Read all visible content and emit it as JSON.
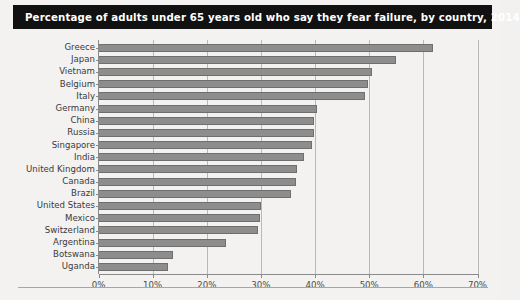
{
  "title": "Percentage of adults under 65 years old who say they fear failure, by country, 2014",
  "chart_data": {
    "type": "bar",
    "orientation": "horizontal",
    "title": "Percentage of adults under 65 years old who say they fear failure, by country, 2014",
    "xlabel": "",
    "ylabel": "",
    "xlim": [
      0,
      70
    ],
    "grid": true,
    "legend": "none",
    "xticks": [
      "0%",
      "10%",
      "20%",
      "30%",
      "40%",
      "50%",
      "60%",
      "70%"
    ],
    "xtick_values": [
      0,
      10,
      20,
      30,
      40,
      50,
      60,
      70
    ],
    "categories": [
      "Greece",
      "Japan",
      "Vietnam",
      "Belgium",
      "Italy",
      "Germany",
      "China",
      "Russia",
      "Singapore",
      "India",
      "United Kingdom",
      "Canada",
      "Brazil",
      "United States",
      "Mexico",
      "Switzerland",
      "Argentina",
      "Botswana",
      "Uganda"
    ],
    "values": [
      61.7,
      55.0,
      50.5,
      49.7,
      49.2,
      40.3,
      39.8,
      39.8,
      39.4,
      38.0,
      36.7,
      36.4,
      35.6,
      30.1,
      29.9,
      29.4,
      23.6,
      13.7,
      12.9
    ],
    "bar_color": "#8d8d8d",
    "bar_edge_color": "#6f6f6f",
    "grid_color": "#b9b9b9",
    "axis_color": "#8a8a8a",
    "title_background": "#111111",
    "title_color": "#ffffff",
    "page_background": "#f3f2f0"
  }
}
